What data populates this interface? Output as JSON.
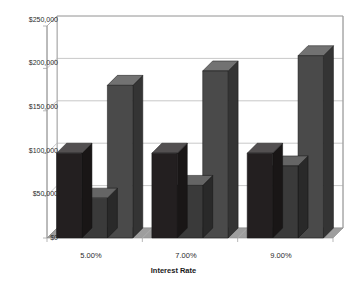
{
  "chart_data": {
    "type": "bar",
    "title": "",
    "xlabel": "Interest Rate",
    "ylabel": "",
    "categories": [
      "5.00%",
      "7.00%",
      "9.00%"
    ],
    "series": [
      {
        "name": "Series 1",
        "values": [
          100000,
          100000,
          100000
        ],
        "color": "#231f20"
      },
      {
        "name": "Series 2",
        "values": [
          47000,
          62000,
          85000
        ],
        "color": "#3a3a3a"
      },
      {
        "name": "Series 3",
        "values": [
          180000,
          197000,
          215000
        ],
        "color": "#4a4a4a"
      }
    ],
    "ylim": [
      0,
      250000
    ],
    "ytick_labels": [
      "$0",
      "$50,000",
      "$100,000",
      "$150,000",
      "$200,000",
      "$250,000"
    ],
    "ytick_values": [
      0,
      50000,
      100000,
      150000,
      200000,
      250000
    ],
    "grid": true,
    "legend": "none",
    "three_d": true,
    "plot_background": "#ffffff",
    "gridline_color": "#b0b0b0",
    "axis_color": "#9a9a9a",
    "floor_color": "#9e9e9e"
  },
  "axis": {
    "x_title": "Interest Rate"
  }
}
